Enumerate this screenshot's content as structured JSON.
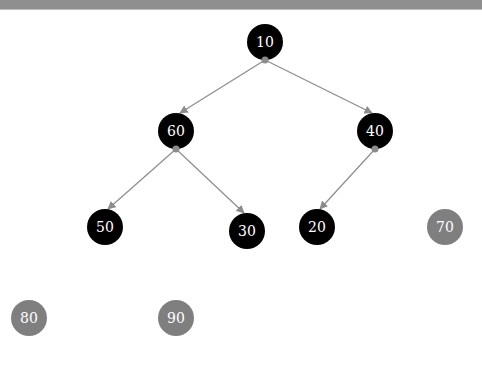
{
  "colors": {
    "topbar": "#8f8f8f",
    "node_in_tree": "#000000",
    "node_detached": "#7f7f7f",
    "edge": "#8c8c8c",
    "label": "#ffffff"
  },
  "tree": {
    "nodes": [
      {
        "id": "n10",
        "label": "10",
        "x": 265,
        "y": 42,
        "state": "in-tree"
      },
      {
        "id": "n60",
        "label": "60",
        "x": 176,
        "y": 131,
        "state": "in-tree"
      },
      {
        "id": "n40",
        "label": "40",
        "x": 375,
        "y": 131,
        "state": "in-tree"
      },
      {
        "id": "n50",
        "label": "50",
        "x": 105,
        "y": 227,
        "state": "in-tree"
      },
      {
        "id": "n30",
        "label": "30",
        "x": 247,
        "y": 231,
        "state": "in-tree"
      },
      {
        "id": "n20",
        "label": "20",
        "x": 317,
        "y": 227,
        "state": "in-tree"
      },
      {
        "id": "n70",
        "label": "70",
        "x": 445,
        "y": 227,
        "state": "detached"
      },
      {
        "id": "n80",
        "label": "80",
        "x": 29,
        "y": 318,
        "state": "detached"
      },
      {
        "id": "n90",
        "label": "90",
        "x": 176,
        "y": 318,
        "state": "detached"
      }
    ],
    "edges": [
      {
        "from": "10",
        "to": "60"
      },
      {
        "from": "10",
        "to": "40"
      },
      {
        "from": "60",
        "to": "50"
      },
      {
        "from": "60",
        "to": "30"
      },
      {
        "from": "40",
        "to": "20"
      }
    ]
  }
}
